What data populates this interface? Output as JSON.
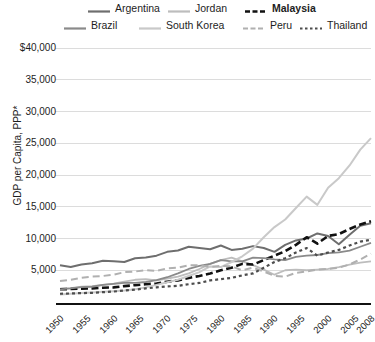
{
  "chart_data": {
    "type": "line",
    "title": "",
    "xlabel": "",
    "ylabel": "GDP per Capita, PPP*",
    "ylim": [
      0,
      40000
    ],
    "xlim": [
      1950,
      2008
    ],
    "grid": true,
    "legend_position": "top",
    "y_ticks": [
      "$40,000",
      "35,000",
      "30,000",
      "25,000",
      "20,000",
      "15,000",
      "10,000",
      "5,000"
    ],
    "y_tick_values": [
      40000,
      35000,
      30000,
      25000,
      20000,
      15000,
      10000,
      5000
    ],
    "x_ticks": [
      "1950",
      "1955",
      "1960",
      "1965",
      "1970",
      "1975",
      "1980",
      "1985",
      "1990",
      "1995",
      "2000",
      "2005",
      "2008"
    ],
    "x_tick_values": [
      1950,
      1955,
      1960,
      1965,
      1970,
      1975,
      1980,
      1985,
      1990,
      1995,
      2000,
      2005,
      2008
    ],
    "x": [
      1950,
      1952,
      1954,
      1956,
      1958,
      1960,
      1962,
      1964,
      1966,
      1968,
      1970,
      1972,
      1974,
      1976,
      1978,
      1980,
      1982,
      1984,
      1986,
      1988,
      1990,
      1992,
      1994,
      1996,
      1998,
      2000,
      2002,
      2004,
      2006,
      2008
    ],
    "series": [
      {
        "name": "Argentina",
        "color": "#6e6e6e",
        "dash": "solid",
        "width": 2.0,
        "values": [
          5800,
          5500,
          5900,
          6100,
          6500,
          6400,
          6300,
          6900,
          7000,
          7300,
          7900,
          8100,
          8700,
          8500,
          8300,
          8900,
          8200,
          8400,
          8800,
          8500,
          7900,
          9000,
          9700,
          10000,
          10800,
          10400,
          9100,
          10600,
          12000,
          12400
        ]
      },
      {
        "name": "Jordan",
        "color": "#bdbdbd",
        "dash": "solid",
        "width": 1.8,
        "values": [
          2100,
          2200,
          2400,
          2500,
          2700,
          2900,
          3200,
          3500,
          3600,
          3400,
          3700,
          4000,
          4500,
          5200,
          6000,
          6600,
          7000,
          6400,
          5800,
          5100,
          4300,
          5000,
          5100,
          5000,
          5100,
          5200,
          5500,
          5900,
          6200,
          6400
        ]
      },
      {
        "name": "Malaysia",
        "color": "#111111",
        "dash": "heavy-dash",
        "width": 2.6,
        "values": [
          2000,
          2050,
          2100,
          2150,
          2250,
          2300,
          2500,
          2650,
          2800,
          2900,
          3200,
          3400,
          3800,
          4100,
          4500,
          5000,
          5400,
          6000,
          5900,
          6600,
          7300,
          8000,
          9000,
          10200,
          9200,
          10400,
          10700,
          11500,
          12200,
          12700
        ]
      },
      {
        "name": "Brazil",
        "color": "#8a8a8a",
        "dash": "solid",
        "width": 1.8,
        "values": [
          2000,
          2150,
          2350,
          2400,
          2700,
          2850,
          3000,
          3000,
          3150,
          3450,
          3900,
          4500,
          5200,
          5700,
          6000,
          6600,
          6400,
          6400,
          7000,
          6900,
          6700,
          6600,
          7100,
          7300,
          7400,
          7700,
          7800,
          8100,
          8700,
          9300
        ]
      },
      {
        "name": "South Korea",
        "color": "#c9c9c9",
        "dash": "solid",
        "width": 2.0,
        "values": [
          1200,
          1300,
          1400,
          1500,
          1600,
          1700,
          1800,
          2000,
          2300,
          2700,
          3100,
          3500,
          4100,
          4700,
          5600,
          5500,
          6300,
          7200,
          8400,
          10200,
          11800,
          13000,
          14800,
          16600,
          15300,
          18000,
          19500,
          21500,
          24000,
          25800
        ]
      },
      {
        "name": "Peru",
        "color": "#b0b0b0",
        "dash": "dash",
        "width": 2.0,
        "values": [
          3300,
          3500,
          3800,
          4000,
          4100,
          4300,
          4700,
          4800,
          5000,
          4900,
          5300,
          5400,
          5800,
          5800,
          5500,
          5700,
          5600,
          5000,
          5400,
          4800,
          4100,
          4000,
          4600,
          4800,
          5100,
          5200,
          5400,
          5900,
          6700,
          7600
        ]
      },
      {
        "name": "Thailand",
        "color": "#4d4d4d",
        "dash": "dot",
        "width": 2.2,
        "values": [
          1300,
          1350,
          1400,
          1450,
          1550,
          1650,
          1800,
          1950,
          2150,
          2300,
          2450,
          2550,
          2800,
          3000,
          3400,
          3600,
          3800,
          4200,
          4500,
          5400,
          6300,
          6900,
          7800,
          8500,
          7300,
          7800,
          8200,
          8900,
          9500,
          9800
        ]
      }
    ]
  }
}
